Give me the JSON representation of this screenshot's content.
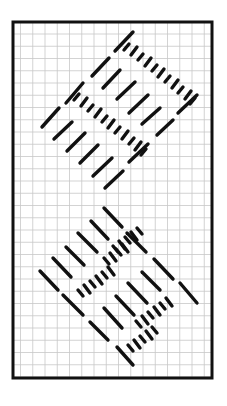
{
  "diagram": {
    "type": "needlepoint-stitch-chart",
    "background": "#ffffff",
    "frame": {
      "x": 13,
      "y": 22,
      "width": 199,
      "height": 356,
      "stroke": "#111111",
      "stroke_width": 3
    },
    "grid": {
      "x0": 20.5,
      "y0": 34,
      "step": 12.25,
      "color": "#c8c8c8",
      "width": 0.8
    },
    "stitch_color": "#111111",
    "stitch_width": 3.4,
    "clusters": [
      {
        "name": "upper-cluster",
        "direction": "slant-up-right",
        "long_stitches": [
          [
            115,
            51,
            133,
            32
          ],
          [
            92,
            76,
            109,
            58
          ],
          [
            103,
            88,
            120,
            70
          ],
          [
            117,
            99,
            135,
            82
          ],
          [
            129,
            113,
            148,
            95
          ],
          [
            142,
            124,
            160,
            108
          ],
          [
            157,
            135,
            173,
            120
          ],
          [
            178,
            113,
            197,
            95
          ],
          [
            66,
            103,
            83,
            83
          ],
          [
            42,
            127,
            59,
            108
          ],
          [
            54,
            139,
            72,
            122
          ],
          [
            67,
            151,
            85,
            133
          ],
          [
            80,
            163,
            98,
            145
          ],
          [
            93,
            176,
            112,
            158
          ],
          [
            105,
            188,
            123,
            171
          ],
          [
            129,
            162,
            148,
            144
          ]
        ],
        "short_stitches": [
          [
            124,
            50,
            129,
            44
          ],
          [
            131,
            55,
            137,
            47
          ],
          [
            138,
            60,
            143,
            54
          ],
          [
            145,
            66,
            151,
            58
          ],
          [
            152,
            71,
            157,
            65
          ],
          [
            158,
            77,
            164,
            69
          ],
          [
            165,
            82,
            170,
            76
          ],
          [
            172,
            88,
            178,
            80
          ],
          [
            178,
            93,
            183,
            87
          ],
          [
            185,
            99,
            191,
            91
          ],
          [
            190,
            104,
            195,
            98
          ],
          [
            74,
            100,
            79,
            94
          ],
          [
            81,
            106,
            87,
            98
          ],
          [
            88,
            111,
            93,
            105
          ],
          [
            95,
            117,
            101,
            109
          ],
          [
            102,
            122,
            107,
            116
          ],
          [
            108,
            128,
            114,
            120
          ],
          [
            115,
            133,
            120,
            127
          ],
          [
            122,
            139,
            128,
            131
          ],
          [
            129,
            144,
            134,
            138
          ],
          [
            135,
            150,
            141,
            142
          ],
          [
            141,
            155,
            146,
            149
          ]
        ]
      },
      {
        "name": "lower-cluster",
        "direction": "slant-down-right",
        "long_stitches": [
          [
            104,
            208,
            122,
            227
          ],
          [
            91,
            221,
            108,
            239
          ],
          [
            78,
            233,
            97,
            252
          ],
          [
            66,
            247,
            84,
            265
          ],
          [
            53,
            258,
            71,
            277
          ],
          [
            40,
            271,
            58,
            290
          ],
          [
            127,
            233,
            146,
            252
          ],
          [
            154,
            259,
            173,
            279
          ],
          [
            180,
            283,
            197,
            303
          ],
          [
            63,
            295,
            83,
            315
          ],
          [
            90,
            322,
            108,
            340
          ],
          [
            104,
            308,
            122,
            328
          ],
          [
            116,
            296,
            134,
            315
          ],
          [
            128,
            283,
            147,
            303
          ],
          [
            142,
            272,
            160,
            290
          ],
          [
            117,
            347,
            133,
            365
          ]
        ],
        "short_stitches": [
          [
            113,
            246,
            118,
            252
          ],
          [
            119,
            241,
            125,
            249
          ],
          [
            125,
            237,
            130,
            243
          ],
          [
            131,
            232,
            137,
            240
          ],
          [
            137,
            228,
            142,
            234
          ],
          [
            104,
            258,
            109,
            264
          ],
          [
            110,
            253,
            116,
            261
          ],
          [
            116,
            249,
            121,
            255
          ],
          [
            122,
            244,
            128,
            252
          ],
          [
            78,
            290,
            83,
            296
          ],
          [
            84,
            285,
            90,
            293
          ],
          [
            90,
            281,
            95,
            287
          ],
          [
            96,
            276,
            102,
            284
          ],
          [
            102,
            272,
            107,
            278
          ],
          [
            108,
            267,
            114,
            275
          ],
          [
            136,
            321,
            141,
            327
          ],
          [
            142,
            316,
            148,
            324
          ],
          [
            148,
            312,
            153,
            318
          ],
          [
            154,
            307,
            160,
            315
          ],
          [
            160,
            303,
            165,
            309
          ],
          [
            166,
            298,
            172,
            306
          ],
          [
            128,
            345,
            133,
            351
          ],
          [
            134,
            340,
            140,
            348
          ],
          [
            140,
            336,
            145,
            342
          ],
          [
            146,
            331,
            152,
            339
          ],
          [
            152,
            327,
            157,
            333
          ]
        ]
      }
    ]
  }
}
